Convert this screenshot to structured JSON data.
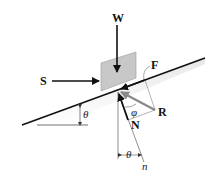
{
  "diagram": {
    "type": "free-body diagram of block on inclined plane",
    "labels": {
      "weight": "W",
      "push_force": "S",
      "friction": "F",
      "resultant": "R",
      "normal": "N",
      "phi": "φ",
      "theta_incline": "θ",
      "theta_normal": "θ",
      "normal_axis": "n"
    },
    "colors": {
      "line": "#111111",
      "block_fill": "#c8c8c8",
      "resultant_arrow": "#8a8a8a",
      "shadow": "#e6e6e6"
    }
  }
}
